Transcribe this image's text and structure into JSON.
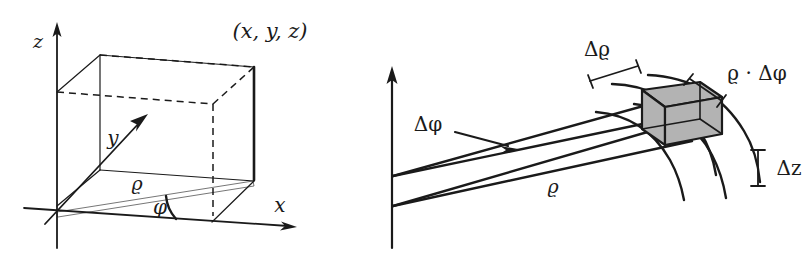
{
  "figure": {
    "background_color": "#ffffff",
    "ink_color": "#1a1a1a",
    "shade_color": "#b3b3b3"
  },
  "left_panel": {
    "name": "cylindrical-coordinate-point-diagram",
    "labels": {
      "axis_z": "z",
      "axis_y": "y",
      "axis_x": "x",
      "point": "(x, y, z)",
      "radius": "ϱ",
      "angle": "φ"
    }
  },
  "right_panel": {
    "name": "cylindrical-volume-element-diagram",
    "labels": {
      "delta_rho": "Δϱ",
      "rho_delta_phi": "ϱ · Δφ",
      "delta_phi": "Δφ",
      "delta_z": "Δz",
      "radius": "ϱ"
    }
  }
}
